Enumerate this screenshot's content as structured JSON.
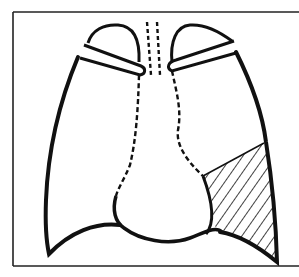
{
  "figure": {
    "type": "anatomical line drawing",
    "colors": {
      "ink": "#111111",
      "background": "#ffffff",
      "frame": "#222222"
    },
    "elements": [
      {
        "name": "frame",
        "style": "thin rectangle border, right side cropped"
      },
      {
        "name": "right-lung-outline",
        "style": "thick solid line"
      },
      {
        "name": "left-lung-outline",
        "style": "thick solid line"
      },
      {
        "name": "right-clavicle",
        "style": "rounded bar outline"
      },
      {
        "name": "left-clavicle",
        "style": "rounded bar outline"
      },
      {
        "name": "trachea",
        "style": "two parallel dashed lines"
      },
      {
        "name": "heart-mediastinum-outline",
        "style": "dashed upper border, solid lower contour"
      },
      {
        "name": "shaded-region",
        "position": "lower left lung field (image right)",
        "style": "diagonal hatching"
      }
    ],
    "text": []
  }
}
